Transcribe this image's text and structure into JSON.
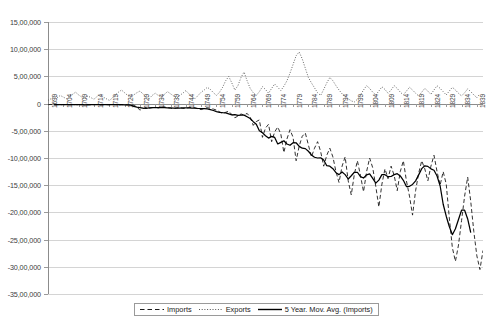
{
  "chart_data": {
    "type": "line",
    "title": "",
    "xlabel": "",
    "ylabel": "",
    "ylim": [
      -3500000,
      1500000
    ],
    "ytick_labels": [
      "15,00,000",
      "10,00,000",
      "5,00,000",
      "0",
      "-5,00,000",
      "-10,00,000",
      "-15,00,000",
      "-20,00,000",
      "-25,00,000",
      "-30,00,000",
      "-35,00,000"
    ],
    "ytick_values": [
      1500000,
      1000000,
      500000,
      0,
      -500000,
      -1000000,
      -1500000,
      -2000000,
      -2500000,
      -3000000,
      -3500000
    ],
    "grid": true,
    "legend_position": "bottom-center",
    "x_start_year": 1699,
    "x_end_year": 1841,
    "xtick_labels": [
      "1699",
      "1704",
      "1709",
      "1714",
      "1719",
      "1724",
      "1729",
      "1734",
      "1739",
      "1744",
      "1749",
      "1754",
      "1759",
      "1764",
      "1769",
      "1774",
      "1779",
      "1784",
      "1789",
      "1794",
      "1799",
      "1804",
      "1809",
      "1814",
      "1819",
      "1824",
      "1829",
      "1834",
      "1839"
    ],
    "xtick_years": [
      1699,
      1704,
      1709,
      1714,
      1719,
      1724,
      1729,
      1734,
      1739,
      1744,
      1749,
      1754,
      1759,
      1764,
      1769,
      1774,
      1779,
      1784,
      1789,
      1794,
      1799,
      1804,
      1809,
      1814,
      1819,
      1824,
      1829,
      1834,
      1839
    ],
    "series": [
      {
        "name": "Imports",
        "style": "dashed",
        "color": "#1a1a1a",
        "years": [
          1699,
          1700,
          1701,
          1702,
          1703,
          1704,
          1705,
          1706,
          1707,
          1708,
          1709,
          1710,
          1711,
          1712,
          1713,
          1714,
          1715,
          1716,
          1717,
          1718,
          1719,
          1720,
          1721,
          1722,
          1723,
          1724,
          1725,
          1726,
          1727,
          1728,
          1729,
          1730,
          1731,
          1732,
          1733,
          1734,
          1735,
          1736,
          1737,
          1738,
          1739,
          1740,
          1741,
          1742,
          1743,
          1744,
          1745,
          1746,
          1747,
          1748,
          1749,
          1750,
          1751,
          1752,
          1753,
          1754,
          1755,
          1756,
          1757,
          1758,
          1759,
          1760,
          1761,
          1762,
          1763,
          1764,
          1765,
          1766,
          1767,
          1768,
          1769,
          1770,
          1771,
          1772,
          1773,
          1774,
          1775,
          1776,
          1777,
          1778,
          1779,
          1780,
          1781,
          1782,
          1783,
          1784,
          1785,
          1786,
          1787,
          1788,
          1789,
          1790,
          1791,
          1792,
          1793,
          1794,
          1795,
          1796,
          1797,
          1798,
          1799,
          1800,
          1801,
          1802,
          1803,
          1804,
          1805,
          1806,
          1807,
          1808,
          1809,
          1810,
          1811,
          1812,
          1813,
          1814,
          1815,
          1816,
          1817,
          1818,
          1819,
          1820,
          1821,
          1822,
          1823,
          1824,
          1825,
          1826,
          1827,
          1828,
          1829,
          1830,
          1831,
          1832,
          1833,
          1834,
          1835,
          1836,
          1837,
          1838,
          1839,
          1840,
          1841
        ],
        "values": [
          -20000,
          -15000,
          -25000,
          -18000,
          -22000,
          -16000,
          -24000,
          -19000,
          -21000,
          -17000,
          -23000,
          -20000,
          -18000,
          -25000,
          -22000,
          -19000,
          -16000,
          -24000,
          -21000,
          -18000,
          -23000,
          -20000,
          -17000,
          -25000,
          -22000,
          -19000,
          -24000,
          -21000,
          -30000,
          -60000,
          -120000,
          -90000,
          -70000,
          -85000,
          -75000,
          -65000,
          -80000,
          -70000,
          -60000,
          -75000,
          -85000,
          -95000,
          -80000,
          -70000,
          -90000,
          -85000,
          -75000,
          -65000,
          -80000,
          -95000,
          -110000,
          -90000,
          -75000,
          -85000,
          -100000,
          -120000,
          -150000,
          -180000,
          -160000,
          -140000,
          -200000,
          -260000,
          -230000,
          -190000,
          -210000,
          -180000,
          -250000,
          -400000,
          -330000,
          -300000,
          -620000,
          -450000,
          -380000,
          -700000,
          -520000,
          -430000,
          -560000,
          -900000,
          -650000,
          -480000,
          -620000,
          -1050000,
          -780000,
          -600000,
          -540000,
          -760000,
          -980000,
          -820000,
          -700000,
          -880000,
          -1150000,
          -950000,
          -820000,
          -980000,
          -1250000,
          -1450000,
          -1150000,
          -980000,
          -1420000,
          -1680000,
          -1300000,
          -1050000,
          -1320000,
          -1620000,
          -1250000,
          -1000000,
          -1180000,
          -1520000,
          -1900000,
          -1480000,
          -1200000,
          -1380000,
          -1150000,
          -1320000,
          -1600000,
          -1250000,
          -1050000,
          -1420000,
          -1700000,
          -2050000,
          -1600000,
          -1280000,
          -1050000,
          -1200000,
          -1420000,
          -1150000,
          -950000,
          -1250000,
          -1500000,
          -1250000,
          -1480000,
          -2100000,
          -2650000,
          -2900000,
          -2600000,
          -2150000,
          -1700000,
          -1350000,
          -1800000,
          -2350000,
          -2800000,
          -3050000,
          -2700000,
          -2400000
        ]
      },
      {
        "name": "Exports",
        "style": "dotted",
        "color": "#555555",
        "years": [
          1699,
          1700,
          1701,
          1702,
          1703,
          1704,
          1705,
          1706,
          1707,
          1708,
          1709,
          1710,
          1711,
          1712,
          1713,
          1714,
          1715,
          1716,
          1717,
          1718,
          1719,
          1720,
          1721,
          1722,
          1723,
          1724,
          1725,
          1726,
          1727,
          1728,
          1729,
          1730,
          1731,
          1732,
          1733,
          1734,
          1735,
          1736,
          1737,
          1738,
          1739,
          1740,
          1741,
          1742,
          1743,
          1744,
          1745,
          1746,
          1747,
          1748,
          1749,
          1750,
          1751,
          1752,
          1753,
          1754,
          1755,
          1756,
          1757,
          1758,
          1759,
          1760,
          1761,
          1762,
          1763,
          1764,
          1765,
          1766,
          1767,
          1768,
          1769,
          1770,
          1771,
          1772,
          1773,
          1774,
          1775,
          1776,
          1777,
          1778,
          1779,
          1780,
          1781,
          1782,
          1783,
          1784,
          1785,
          1786,
          1787,
          1788,
          1789,
          1790,
          1791,
          1792,
          1793,
          1794,
          1795,
          1796,
          1797,
          1798,
          1799,
          1800,
          1801,
          1802,
          1803,
          1804,
          1805,
          1806,
          1807,
          1808,
          1809,
          1810,
          1811,
          1812,
          1813,
          1814,
          1815,
          1816,
          1817,
          1818,
          1819,
          1820,
          1821,
          1822,
          1823,
          1824,
          1825,
          1826,
          1827,
          1828,
          1829,
          1830,
          1831,
          1832,
          1833,
          1834,
          1835,
          1836,
          1837,
          1838,
          1839,
          1840,
          1841
        ],
        "values": [
          60000,
          90000,
          130000,
          110000,
          150000,
          120000,
          90000,
          140000,
          170000,
          210000,
          160000,
          120000,
          90000,
          140000,
          110000,
          80000,
          130000,
          170000,
          120000,
          90000,
          60000,
          100000,
          160000,
          210000,
          250000,
          200000,
          150000,
          110000,
          160000,
          200000,
          230000,
          180000,
          120000,
          90000,
          150000,
          190000,
          150000,
          110000,
          170000,
          220000,
          180000,
          140000,
          100000,
          150000,
          190000,
          240000,
          180000,
          130000,
          90000,
          150000,
          210000,
          250000,
          300000,
          260000,
          200000,
          150000,
          210000,
          300000,
          420000,
          500000,
          380000,
          250000,
          330000,
          480000,
          580000,
          420000,
          280000,
          200000,
          150000,
          220000,
          310000,
          260000,
          190000,
          280000,
          360000,
          300000,
          240000,
          320000,
          420000,
          560000,
          720000,
          880000,
          950000,
          820000,
          650000,
          480000,
          380000,
          290000,
          200000,
          150000,
          260000,
          380000,
          480000,
          420000,
          330000,
          250000,
          180000,
          130000,
          90000,
          50000,
          30000,
          80000,
          160000,
          250000,
          330000,
          280000,
          210000,
          160000,
          230000,
          310000,
          260000,
          190000,
          250000,
          330000,
          280000,
          210000,
          160000,
          230000,
          300000,
          250000,
          190000,
          140000,
          210000,
          280000,
          230000,
          170000,
          250000,
          330000,
          280000,
          220000,
          160000,
          230000,
          300000,
          250000,
          190000,
          140000,
          200000,
          270000,
          220000,
          160000,
          110000,
          180000
        ]
      },
      {
        "name": "5 Year. Mov. Avg. (Imports)",
        "style": "solid",
        "color": "#000000",
        "years": [
          1701,
          1702,
          1703,
          1704,
          1705,
          1706,
          1707,
          1708,
          1709,
          1710,
          1711,
          1712,
          1713,
          1714,
          1715,
          1716,
          1717,
          1718,
          1719,
          1720,
          1721,
          1722,
          1723,
          1724,
          1725,
          1726,
          1727,
          1728,
          1729,
          1730,
          1731,
          1732,
          1733,
          1734,
          1735,
          1736,
          1737,
          1738,
          1739,
          1740,
          1741,
          1742,
          1743,
          1744,
          1745,
          1746,
          1747,
          1748,
          1749,
          1750,
          1751,
          1752,
          1753,
          1754,
          1755,
          1756,
          1757,
          1758,
          1759,
          1760,
          1761,
          1762,
          1763,
          1764,
          1765,
          1766,
          1767,
          1768,
          1769,
          1770,
          1771,
          1772,
          1773,
          1774,
          1775,
          1776,
          1777,
          1778,
          1779,
          1780,
          1781,
          1782,
          1783,
          1784,
          1785,
          1786,
          1787,
          1788,
          1789,
          1790,
          1791,
          1792,
          1793,
          1794,
          1795,
          1796,
          1797,
          1798,
          1799,
          1800,
          1801,
          1802,
          1803,
          1804,
          1805,
          1806,
          1807,
          1808,
          1809,
          1810,
          1811,
          1812,
          1813,
          1814,
          1815,
          1816,
          1817,
          1818,
          1819,
          1820,
          1821,
          1822,
          1823,
          1824,
          1825,
          1826,
          1827,
          1828,
          1829,
          1830,
          1831,
          1832,
          1833,
          1834,
          1835,
          1836,
          1837,
          1838,
          1839
        ],
        "values": [
          -20000,
          -19000,
          -21000,
          -20000,
          -20000,
          -19000,
          -21000,
          -20000,
          -20000,
          -21000,
          -22000,
          -21000,
          -20000,
          -21000,
          -21000,
          -20000,
          -21000,
          -21000,
          -20000,
          -21000,
          -21000,
          -21000,
          -21000,
          -22000,
          -23000,
          -29000,
          -51000,
          -64000,
          -73000,
          -84000,
          -88000,
          -78000,
          -75000,
          -75000,
          -72000,
          -70000,
          -74000,
          -77000,
          -79000,
          -81000,
          -84000,
          -84000,
          -80000,
          -77000,
          -79000,
          -81000,
          -85000,
          -90000,
          -92000,
          -93000,
          -98000,
          -110000,
          -127000,
          -146000,
          -162000,
          -168000,
          -172000,
          -188000,
          -208000,
          -204000,
          -218000,
          -214000,
          -212000,
          -242000,
          -274000,
          -332000,
          -380000,
          -500000,
          -536000,
          -590000,
          -634000,
          -602000,
          -622000,
          -742000,
          -712000,
          -684000,
          -742000,
          -766000,
          -718000,
          -720000,
          -786000,
          -820000,
          -828000,
          -876000,
          -944000,
          -986000,
          -1000000,
          -996000,
          -1036000,
          -1142000,
          -1150000,
          -1196000,
          -1270000,
          -1306000,
          -1256000,
          -1306000,
          -1386000,
          -1326000,
          -1262000,
          -1262000,
          -1342000,
          -1368000,
          -1310000,
          -1292000,
          -1376000,
          -1462000,
          -1406000,
          -1306000,
          -1306000,
          -1344000,
          -1340000,
          -1306000,
          -1288000,
          -1330000,
          -1410000,
          -1524000,
          -1520000,
          -1486000,
          -1420000,
          -1310000,
          -1196000,
          -1144000,
          -1154000,
          -1200000,
          -1226000,
          -1330000,
          -1510000,
          -1850000,
          -2070000,
          -2260000,
          -2410000,
          -2300000,
          -2130000,
          -1960000,
          -1960000,
          -2120000,
          -2370000
        ]
      }
    ]
  },
  "legend": {
    "items": [
      {
        "label": "Imports",
        "style": "dashed"
      },
      {
        "label": "Exports",
        "style": "dotted"
      },
      {
        "label": "5 Year. Mov. Avg. (Imports)",
        "style": "solid"
      }
    ]
  }
}
